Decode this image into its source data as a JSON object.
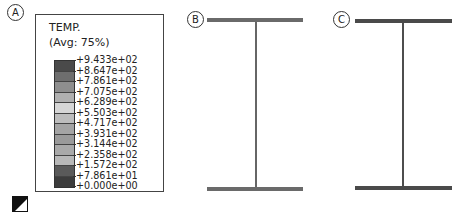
{
  "panels": [
    {
      "label": "A"
    },
    {
      "label": "B"
    },
    {
      "label": "C"
    }
  ],
  "legend": {
    "title": "TEMP.",
    "subtitle": "(Avg: 75%)",
    "ticks": [
      "+9.433e+02",
      "+8.647e+02",
      "+7.861e+02",
      "+7.075e+02",
      "+6.289e+02",
      "+5.503e+02",
      "+4.717e+02",
      "+3.931e+02",
      "+3.144e+02",
      "+2.358e+02",
      "+1.572e+02",
      "+7.861e+01",
      "+0.000e+00"
    ],
    "segment_colors": [
      "#4a4a4a",
      "#6e6e6e",
      "#8e8e8e",
      "#b0b0b0",
      "#d6d6d6",
      "#bdbdbd",
      "#a4a4a4",
      "#9a9a9a",
      "#a9a9a9",
      "#b8b8b8",
      "#5a5a5a",
      "#3c3c3c"
    ]
  },
  "beams": {
    "B": {
      "color": "#6a6a6a"
    },
    "C": {
      "color": "#4a4a4a"
    }
  },
  "icons": {
    "triad": "view-orientation-icon"
  }
}
